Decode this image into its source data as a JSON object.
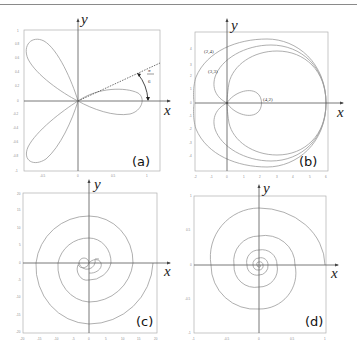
{
  "figure": {
    "panels": [
      {
        "id": "a",
        "label": "(a)",
        "xlabel": "x",
        "ylabel": "y",
        "curve": "three-petal rose rotated",
        "angle_annotation": {
          "numerator": "π",
          "denominator": "6"
        },
        "xticks": [
          "-0.5",
          "0",
          "0.5",
          "1"
        ],
        "yticks": [
          "1",
          "0.8",
          "0.6",
          "0.4",
          "0.2",
          "0",
          "-0.2",
          "-0.4",
          "-0.6",
          "-0.8",
          "-1"
        ]
      },
      {
        "id": "b",
        "label": "(b)",
        "xlabel": "x",
        "ylabel": "y",
        "curve": "limaçon family",
        "annotations": [
          "(2,4)",
          "(3,3)",
          "(4,2)"
        ],
        "xticks": [
          "-2",
          "-1",
          "0",
          "1",
          "2",
          "3",
          "4",
          "5",
          "6"
        ],
        "yticks": [
          "4",
          "3",
          "2",
          "1",
          "0",
          "-1",
          "-2",
          "-3",
          "-4"
        ]
      },
      {
        "id": "c",
        "label": "(c)",
        "xlabel": "x",
        "ylabel": "y",
        "curve": "Archimedean spiral",
        "xticks": [
          "-20",
          "-15",
          "-10",
          "-5",
          "0",
          "5",
          "10",
          "15",
          "20"
        ],
        "yticks": [
          "20",
          "15",
          "10",
          "5",
          "0",
          "-5",
          "-10",
          "-15",
          "-20"
        ]
      },
      {
        "id": "d",
        "label": "(d)",
        "xlabel": "x",
        "ylabel": "y",
        "curve": "logarithmic spiral",
        "xticks": [
          "-1",
          "-0.5",
          "0",
          "0.5",
          "1"
        ],
        "yticks": [
          "1",
          "0.5",
          "0",
          "-0.5",
          "-1"
        ]
      }
    ]
  }
}
